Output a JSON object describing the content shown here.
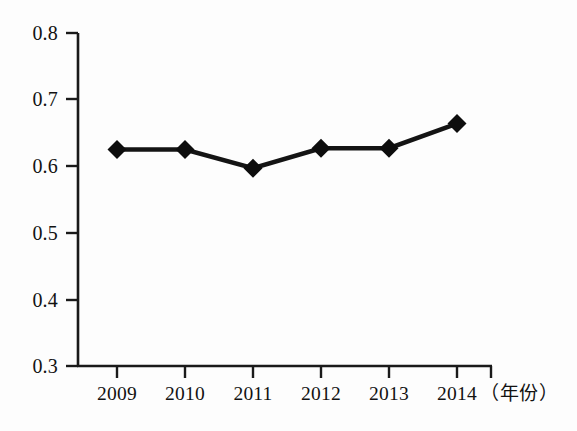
{
  "chart_data": {
    "type": "line",
    "title": "",
    "xlabel": "（年份）",
    "ylabel": "",
    "categories": [
      "2009",
      "2010",
      "2011",
      "2012",
      "2013",
      "2014"
    ],
    "values": [
      0.625,
      0.625,
      0.597,
      0.627,
      0.627,
      0.664
    ],
    "series": [
      {
        "name": "",
        "values": [
          0.625,
          0.625,
          0.597,
          0.627,
          0.627,
          0.664
        ]
      }
    ],
    "ylim": [
      0.3,
      0.8
    ],
    "y_ticks": [
      "0.8",
      "0.7",
      "0.6",
      "0.5",
      "0.4",
      "0.3"
    ],
    "y_tick_values": [
      0.8,
      0.7,
      0.6,
      0.5,
      0.4,
      0.3
    ],
    "x_ticks": [
      "2009",
      "2010",
      "2011",
      "2012",
      "2013",
      "2014"
    ],
    "grid": false,
    "legend": "none",
    "marker": "diamond",
    "line_color": "#141414",
    "marker_color": "#0d0d0d",
    "axis_color": "#1a1a1a"
  },
  "axis": {
    "x_title": "（年份）"
  }
}
